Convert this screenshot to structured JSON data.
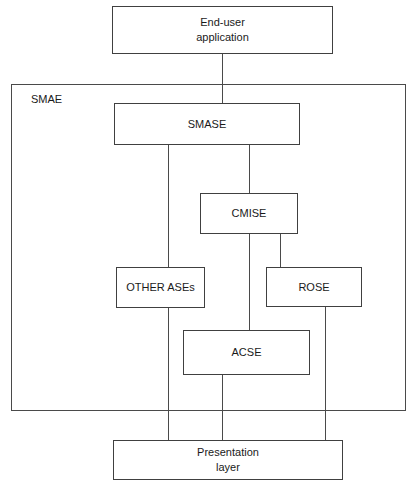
{
  "diagram": {
    "group": {
      "name": "smae-group",
      "label": "SMAE",
      "x": 11,
      "y": 84,
      "width": 395,
      "height": 327
    },
    "boxes": [
      {
        "id": "end-user-application",
        "label": "End-user\napplication",
        "x": 112,
        "y": 6,
        "width": 221,
        "height": 48
      },
      {
        "id": "smase",
        "label": "SMASE",
        "x": 114,
        "y": 103,
        "width": 186,
        "height": 42
      },
      {
        "id": "cmise",
        "label": "CMISE",
        "x": 200,
        "y": 193,
        "width": 98,
        "height": 41
      },
      {
        "id": "other-ases",
        "label": "OTHER ASEs",
        "x": 116,
        "y": 267,
        "width": 89,
        "height": 41
      },
      {
        "id": "rose",
        "label": "ROSE",
        "x": 266,
        "y": 267,
        "width": 96,
        "height": 40
      },
      {
        "id": "acse",
        "label": "ACSE",
        "x": 183,
        "y": 330,
        "width": 127,
        "height": 45
      },
      {
        "id": "presentation-layer",
        "label": "Presentation\nlayer",
        "x": 113,
        "y": 440,
        "width": 230,
        "height": 40
      }
    ],
    "connectors": [
      {
        "id": "enduser-to-smase",
        "orient": "v",
        "x": 222,
        "y": 54,
        "length": 49
      },
      {
        "id": "smase-to-otherases",
        "orient": "v",
        "x": 168,
        "y": 145,
        "length": 122
      },
      {
        "id": "smase-to-cmise",
        "orient": "v",
        "x": 249,
        "y": 145,
        "length": 48
      },
      {
        "id": "cmise-to-acse",
        "orient": "v",
        "x": 249,
        "y": 234,
        "length": 96
      },
      {
        "id": "cmise-to-rose-down",
        "orient": "v",
        "x": 280,
        "y": 234,
        "length": 33
      },
      {
        "id": "cmise-to-rose-stub",
        "orient": "v",
        "x": 280,
        "y": 234,
        "length": 33
      },
      {
        "id": "otherases-to-pres",
        "orient": "v",
        "x": 168,
        "y": 308,
        "length": 134
      },
      {
        "id": "rose-to-pres",
        "orient": "v",
        "x": 325,
        "y": 307,
        "length": 135
      },
      {
        "id": "acse-to-pres",
        "orient": "v",
        "x": 222,
        "y": 375,
        "length": 67
      }
    ],
    "colors": {
      "background": "#ffffff",
      "stroke": "#4a4a4a",
      "text": "#1a1a1a"
    }
  }
}
